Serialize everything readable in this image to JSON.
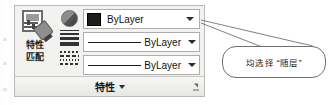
{
  "panel": {
    "name": "properties-panel",
    "footer_title": "特性",
    "footer_caret": "▾",
    "launcher_icon": "dialog-launcher-icon",
    "match_properties": {
      "label_line1": "特性",
      "label_line2": "匹配",
      "icon": "match-properties-icon"
    },
    "icons": [
      {
        "name": "object-color-icon",
        "tooltip": "对象颜色"
      },
      {
        "name": "lineweight-icon",
        "tooltip": "线宽"
      },
      {
        "name": "linetype-icon",
        "tooltip": "线型"
      }
    ],
    "rows": [
      {
        "id": "object-color",
        "kind": "color",
        "value": "ByLayer",
        "swatch_color": "#1c1c1c",
        "caret": "▾"
      },
      {
        "id": "lineweight",
        "kind": "line",
        "value": "ByLayer",
        "line_color": "#1b1b1b",
        "caret": "▾"
      },
      {
        "id": "linetype",
        "kind": "line",
        "value": "ByLayer",
        "line_color": "#1b1b1b",
        "caret": "▾"
      }
    ]
  },
  "annotation": {
    "callout_text": "均选择 “随层”",
    "leader_name": "callout-leader-line"
  },
  "colors": {
    "panel_bg": "#f2f2f0",
    "panel_border": "#b9b9b6",
    "field_bg": "#ffffff",
    "field_border": "#adadaa",
    "text": "#111111",
    "callout_border": "#6f6f6f"
  }
}
